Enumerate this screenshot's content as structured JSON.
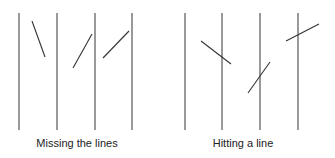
{
  "colors": {
    "background": "#ffffff",
    "line": "#555555",
    "needle": "#333333",
    "text": "#222222"
  },
  "panels": [
    {
      "caption": "Missing the lines",
      "caption_x": 77,
      "vertical_lines_x": [
        19,
        57,
        95,
        132
      ],
      "line_top": 13,
      "line_bottom": 130,
      "needles": [
        {
          "x1": 32,
          "y1": 21,
          "x2": 45,
          "y2": 57
        },
        {
          "x1": 92,
          "y1": 34,
          "x2": 73,
          "y2": 68
        },
        {
          "x1": 129,
          "y1": 31,
          "x2": 103,
          "y2": 58
        }
      ]
    },
    {
      "caption": "Hitting a line",
      "caption_x": 243,
      "vertical_lines_x": [
        185,
        222,
        260,
        298
      ],
      "line_top": 13,
      "line_bottom": 130,
      "needles": [
        {
          "x1": 201,
          "y1": 41,
          "x2": 231,
          "y2": 64
        },
        {
          "x1": 270,
          "y1": 62,
          "x2": 248,
          "y2": 93
        },
        {
          "x1": 319,
          "y1": 24,
          "x2": 286,
          "y2": 41
        }
      ]
    }
  ]
}
